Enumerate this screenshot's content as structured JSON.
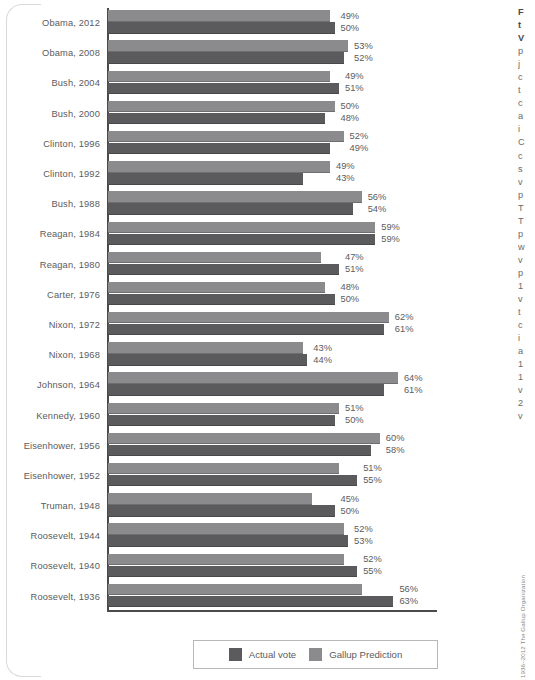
{
  "chart_data": {
    "type": "bar",
    "orientation": "horizontal",
    "title": "",
    "xlabel": "",
    "ylabel": "",
    "xlim": [
      0,
      70
    ],
    "grid": false,
    "legend_position": "bottom",
    "categories": [
      "Obama, 2012",
      "Obama, 2008",
      "Bush, 2004",
      "Bush, 2000",
      "Clinton, 1996",
      "Clinton, 1992",
      "Bush, 1988",
      "Reagan, 1984",
      "Reagan, 1980",
      "Carter, 1976",
      "Nixon, 1972",
      "Nixon, 1968",
      "Johnson, 1964",
      "Kennedy, 1960",
      "Eisenhower, 1956",
      "Eisenhower, 1952",
      "Truman, 1948",
      "Roosevelt, 1944",
      "Roosevelt, 1940",
      "Roosevelt, 1936"
    ],
    "series": [
      {
        "name": "Gallup Prediction",
        "color": "#8b8b8d",
        "values": [
          49,
          53,
          49,
          50,
          52,
          49,
          56,
          59,
          47,
          48,
          62,
          43,
          64,
          51,
          60,
          51,
          45,
          52,
          52,
          56
        ],
        "labels": [
          "49%",
          "53%",
          "49%",
          "50%",
          "52%",
          "49%",
          "56%",
          "59%",
          "47%",
          "48%",
          "62%",
          "43%",
          "64%",
          "51%",
          "60%",
          "51%",
          "45%",
          "52%",
          "52%",
          "56%"
        ]
      },
      {
        "name": "Actual vote",
        "color": "#5b5b5d",
        "values": [
          50,
          52,
          51,
          48,
          49,
          43,
          54,
          59,
          51,
          50,
          61,
          44,
          61,
          50,
          58,
          55,
          50,
          53,
          55,
          63
        ],
        "labels": [
          "50%",
          "52%",
          "51%",
          "48%",
          "49%",
          "43%",
          "54%",
          "59%",
          "51%",
          "50%",
          "61%",
          "44%",
          "61%",
          "50%",
          "58%",
          "55%",
          "50%",
          "53%",
          "55%",
          "63%"
        ]
      }
    ]
  },
  "legend": {
    "actual_label": "Actual vote",
    "prediction_label": "Gallup Prediction"
  },
  "side_column_lines": [
    "F",
    "t",
    "V",
    "p",
    "j",
    "c",
    "t",
    "c",
    "a",
    "i",
    "C",
    "c",
    "s",
    "v",
    "p",
    "T",
    "T",
    "p",
    "w",
    "v",
    "p",
    "1",
    "v",
    "t",
    "c",
    "i",
    "a",
    "1",
    "1",
    "v",
    "2",
    "v"
  ],
  "credit": "1936–2012 The Gallup Organization"
}
